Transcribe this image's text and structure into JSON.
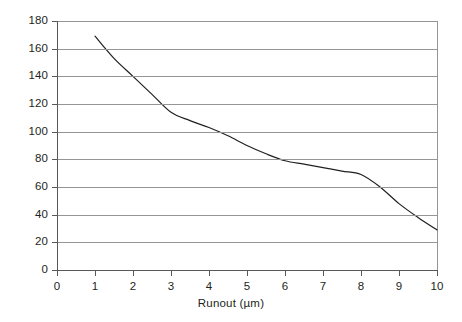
{
  "chart_data": {
    "type": "line",
    "title": "",
    "xlabel": "Runout (µm)",
    "ylabel": "Tool life (%)",
    "xlim": [
      0,
      10
    ],
    "ylim": [
      0,
      180
    ],
    "xticks": [
      "0",
      "1",
      "2",
      "3",
      "4",
      "5",
      "6",
      "7",
      "8",
      "9",
      "10"
    ],
    "yticks": [
      "0",
      "20",
      "40",
      "60",
      "80",
      "100",
      "120",
      "140",
      "160",
      "180"
    ],
    "grid": "horizontal",
    "legend": "none",
    "line_color": "#231f20",
    "x": [
      1,
      1.5,
      2,
      2.5,
      3,
      3.5,
      4,
      4.5,
      5,
      5.5,
      6,
      6.5,
      7,
      7.5,
      8,
      8.5,
      9,
      9.5,
      10
    ],
    "values": [
      169,
      153,
      140,
      127,
      114,
      108,
      103,
      97,
      90,
      84,
      79,
      76.5,
      74,
      71.5,
      69,
      60,
      48,
      38,
      29
    ],
    "series": [
      {
        "name": "Tool life vs runout",
        "values": [
          169,
          153,
          140,
          127,
          114,
          108,
          103,
          97,
          90,
          84,
          79,
          76.5,
          74,
          71.5,
          69,
          60,
          48,
          38,
          29
        ]
      }
    ]
  },
  "axes": {
    "y": {
      "ticks": [
        {
          "label": "0",
          "value": 0
        },
        {
          "label": "20",
          "value": 20
        },
        {
          "label": "40",
          "value": 40
        },
        {
          "label": "60",
          "value": 60
        },
        {
          "label": "80",
          "value": 80
        },
        {
          "label": "100",
          "value": 100
        },
        {
          "label": "120",
          "value": 120
        },
        {
          "label": "140",
          "value": 140
        },
        {
          "label": "160",
          "value": 160
        },
        {
          "label": "180",
          "value": 180
        }
      ],
      "title": "Tool life (%)"
    },
    "x": {
      "ticks": [
        {
          "label": "0",
          "value": 0
        },
        {
          "label": "1",
          "value": 1
        },
        {
          "label": "2",
          "value": 2
        },
        {
          "label": "3",
          "value": 3
        },
        {
          "label": "4",
          "value": 4
        },
        {
          "label": "5",
          "value": 5
        },
        {
          "label": "6",
          "value": 6
        },
        {
          "label": "7",
          "value": 7
        },
        {
          "label": "8",
          "value": 8
        },
        {
          "label": "9",
          "value": 9
        },
        {
          "label": "10",
          "value": 10
        }
      ],
      "title": "Runout (µm)"
    }
  },
  "colors": {
    "background": "#ffffff",
    "gridline": "#939598",
    "axis": "#58595b",
    "curve": "#231f20",
    "text": "#231f20"
  }
}
